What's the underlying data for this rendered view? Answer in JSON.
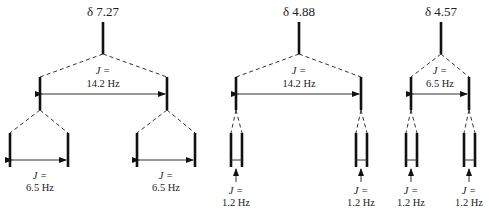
{
  "diagram": {
    "type": "NMR splitting tree diagram",
    "multiplets": [
      {
        "shift_label": "δ 7.27",
        "first_coupling": {
          "j": "J =",
          "value": "14.2 Hz"
        },
        "second_coupling": [
          {
            "j": "J =",
            "value": "6.5 Hz"
          },
          {
            "j": "J =",
            "value": "6.5 Hz"
          }
        ]
      },
      {
        "shift_label": "δ 4.88",
        "first_coupling": {
          "j": "J =",
          "value": "14.2 Hz"
        },
        "second_coupling": [
          {
            "j": "J =",
            "value": "1.2 Hz"
          },
          {
            "j": "J =",
            "value": "1.2 Hz"
          }
        ]
      },
      {
        "shift_label": "δ 4.57",
        "first_coupling": {
          "j": "J =",
          "value": "6.5 Hz"
        },
        "second_coupling": [
          {
            "j": "J =",
            "value": "1.2 Hz"
          },
          {
            "j": "J =",
            "value": "1.2 Hz"
          }
        ]
      }
    ]
  }
}
